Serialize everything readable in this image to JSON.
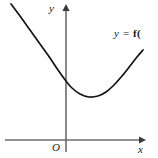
{
  "figure": {
    "background_color": "#ffffff",
    "axis_color": "#6b6b6b",
    "curve_color": "#141414",
    "text_color": "#1a1a1a"
  },
  "labels": {
    "y_axis": "y",
    "x_axis": "x",
    "origin": "O",
    "function_prefix": "y = ",
    "function_name": "f(",
    "function_full": "y = f("
  },
  "chart_data": {
    "type": "line",
    "title": "",
    "xlabel": "x",
    "ylabel": "y",
    "legend": [
      "y = f("
    ],
    "grid": false,
    "axes": {
      "x_axis_pixel_y": 140,
      "y_axis_pixel_x": 66,
      "x_axis_start_px": 5,
      "x_axis_end_px": 143,
      "y_axis_top_px": 6,
      "y_axis_bottom_px": 152,
      "x_arrow": true,
      "y_arrow": true
    },
    "curve": {
      "shape": "upward-parabola",
      "vertex_px": [
        89,
        97
      ],
      "y_intercept_px": [
        66,
        92
      ],
      "start_px": [
        11,
        4
      ],
      "end_px": [
        143,
        50
      ],
      "points_px": [
        [
          11,
          4
        ],
        [
          20,
          16
        ],
        [
          30,
          30
        ],
        [
          40,
          44
        ],
        [
          50,
          58
        ],
        [
          58,
          70
        ],
        [
          66,
          81
        ],
        [
          72,
          88
        ],
        [
          80,
          94
        ],
        [
          89,
          97
        ],
        [
          98,
          96
        ],
        [
          106,
          92
        ],
        [
          114,
          85
        ],
        [
          122,
          76
        ],
        [
          130,
          66
        ],
        [
          137,
          57
        ],
        [
          143,
          50
        ]
      ]
    }
  }
}
